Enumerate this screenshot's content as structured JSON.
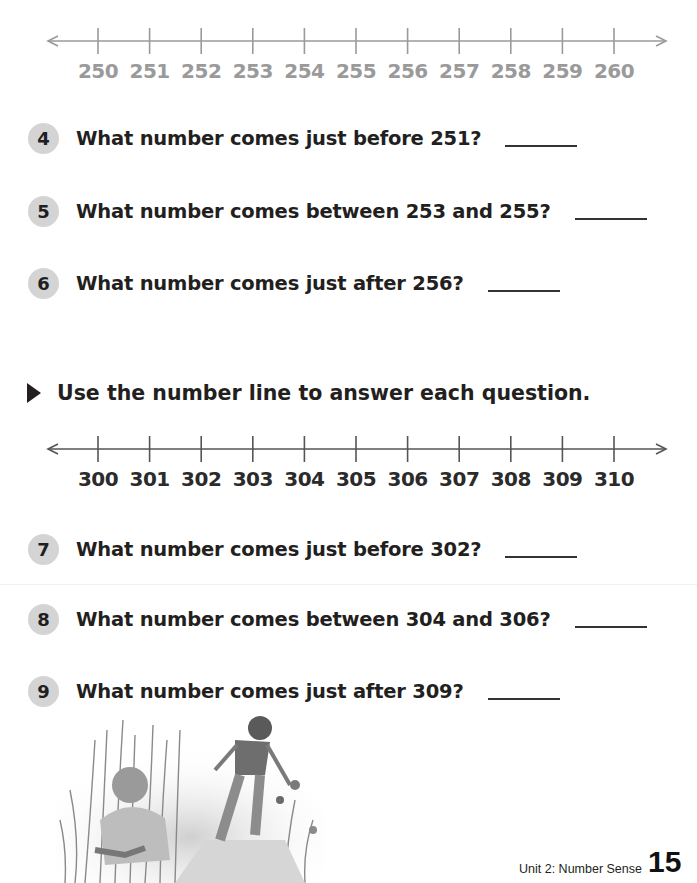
{
  "number_lines": [
    {
      "id": "line-250",
      "style": "faded",
      "color": "#9a9a9a",
      "labels": [
        "250",
        "251",
        "252",
        "253",
        "254",
        "255",
        "256",
        "257",
        "258",
        "259",
        "260"
      ]
    },
    {
      "id": "line-300",
      "style": "dark",
      "color": "#555555",
      "labels": [
        "300",
        "301",
        "302",
        "303",
        "304",
        "305",
        "306",
        "307",
        "308",
        "309",
        "310"
      ]
    }
  ],
  "questions_set1": [
    {
      "number": "4",
      "text": "What number comes just before 251?",
      "answer": ""
    },
    {
      "number": "5",
      "text": "What number comes between 253 and 255?",
      "answer": ""
    },
    {
      "number": "6",
      "text": "What number comes just after 256?",
      "answer": ""
    }
  ],
  "instruction": {
    "icon": "triangle-bullet-icon",
    "text": "Use the number line to answer each question."
  },
  "questions_set2": [
    {
      "number": "7",
      "text": "What number comes just before 302?",
      "answer": ""
    },
    {
      "number": "8",
      "text": "What number comes between 304 and 306?",
      "answer": ""
    },
    {
      "number": "9",
      "text": "What number comes just after 309?",
      "answer": ""
    }
  ],
  "illustration": {
    "description": "Children exploring tall grass and wildflowers"
  },
  "footer": {
    "unit": "Unit 2: Number Sense",
    "page_number": "15"
  },
  "colors": {
    "badge": "#d4d4d4",
    "text": "#231f20",
    "faded": "#9a9a9a"
  }
}
